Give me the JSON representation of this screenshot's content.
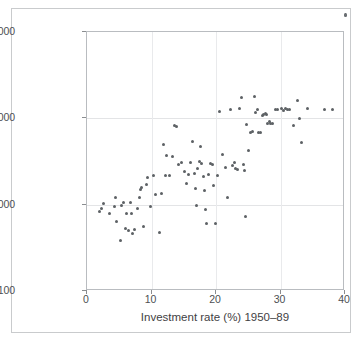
{
  "chart_data": {
    "type": "scatter",
    "title": "",
    "subtitle": "",
    "xlabel": "Investment rate (%) 1950–89",
    "ylabel": "GDP per capita (log scale) 1989",
    "xlim": [
      0,
      40
    ],
    "ylim": [
      100,
      100000
    ],
    "yscale": "log",
    "xticks": [
      "0",
      "10",
      "20",
      "30",
      "40"
    ],
    "xtick_values": [
      0,
      10,
      20,
      30,
      40
    ],
    "yticks": [
      "100",
      "1,000",
      "10,000",
      "100,000"
    ],
    "ytick_values": [
      100,
      1000,
      10000,
      100000
    ],
    "grid": "both-light",
    "legend": "none",
    "marker": {
      "shape": "circle",
      "color": "#5d6165",
      "size_px": 3
    },
    "n_points": 105,
    "points": [
      [
        2.0,
        840
      ],
      [
        2.2,
        900
      ],
      [
        2.6,
        1040
      ],
      [
        3.5,
        800
      ],
      [
        4.2,
        960
      ],
      [
        4.4,
        1210
      ],
      [
        4.6,
        640
      ],
      [
        5.2,
        380
      ],
      [
        5.4,
        980
      ],
      [
        5.6,
        1050
      ],
      [
        5.9,
        530
      ],
      [
        6.1,
        780
      ],
      [
        6.4,
        500
      ],
      [
        6.7,
        1060
      ],
      [
        6.9,
        800
      ],
      [
        7.1,
        460
      ],
      [
        7.4,
        520
      ],
      [
        7.9,
        900
      ],
      [
        8.1,
        1210
      ],
      [
        8.3,
        1480
      ],
      [
        8.5,
        1560
      ],
      [
        8.8,
        560
      ],
      [
        9.2,
        1700
      ],
      [
        9.4,
        2050
      ],
      [
        9.8,
        950
      ],
      [
        10.3,
        2150
      ],
      [
        10.6,
        1300
      ],
      [
        11.2,
        480
      ],
      [
        11.5,
        1350
      ],
      [
        11.8,
        5000
      ],
      [
        12.1,
        2150
      ],
      [
        12.4,
        3700
      ],
      [
        12.8,
        2150
      ],
      [
        13.2,
        3600
      ],
      [
        13.6,
        8200
      ],
      [
        13.9,
        8100
      ],
      [
        14.2,
        2900
      ],
      [
        14.6,
        3050
      ],
      [
        15.1,
        2450
      ],
      [
        15.4,
        1780
      ],
      [
        15.8,
        2250
      ],
      [
        16.1,
        3100
      ],
      [
        16.4,
        5400
      ],
      [
        16.6,
        2300
      ],
      [
        16.8,
        1520
      ],
      [
        17.0,
        980
      ],
      [
        17.2,
        2600
      ],
      [
        17.4,
        3150
      ],
      [
        17.6,
        4700
      ],
      [
        17.8,
        3000
      ],
      [
        18.0,
        2100
      ],
      [
        18.2,
        1450
      ],
      [
        18.4,
        870
      ],
      [
        18.6,
        610
      ],
      [
        18.9,
        2250
      ],
      [
        19.1,
        3000
      ],
      [
        19.4,
        2950
      ],
      [
        19.6,
        1650
      ],
      [
        19.9,
        610
      ],
      [
        20.3,
        2150
      ],
      [
        20.6,
        12000
      ],
      [
        21.0,
        3800
      ],
      [
        21.4,
        2700
      ],
      [
        21.8,
        1200
      ],
      [
        22.2,
        12800
      ],
      [
        22.5,
        2850
      ],
      [
        22.8,
        3100
      ],
      [
        23.1,
        2650
      ],
      [
        23.4,
        2550
      ],
      [
        23.7,
        13000
      ],
      [
        23.9,
        17500
      ],
      [
        24.2,
        2900
      ],
      [
        24.4,
        2500
      ],
      [
        24.6,
        720
      ],
      [
        24.8,
        8500
      ],
      [
        25.0,
        4200
      ],
      [
        25.3,
        6900
      ],
      [
        25.6,
        7100
      ],
      [
        25.9,
        17800
      ],
      [
        26.2,
        11800
      ],
      [
        26.4,
        12500
      ],
      [
        26.6,
        6800
      ],
      [
        26.9,
        6800
      ],
      [
        27.2,
        10900
      ],
      [
        27.4,
        11100
      ],
      [
        27.6,
        11300
      ],
      [
        27.8,
        11000
      ],
      [
        28.0,
        8700
      ],
      [
        28.3,
        9200
      ],
      [
        28.5,
        8600
      ],
      [
        28.8,
        8700
      ],
      [
        29.2,
        12700
      ],
      [
        29.6,
        12600
      ],
      [
        30.1,
        12900
      ],
      [
        30.5,
        12300
      ],
      [
        30.8,
        13000
      ],
      [
        31.1,
        12600
      ],
      [
        31.4,
        12800
      ],
      [
        32.0,
        8300
      ],
      [
        32.6,
        16200
      ],
      [
        33.0,
        10000
      ],
      [
        33.3,
        5200
      ],
      [
        34.2,
        13000
      ],
      [
        36.8,
        12600
      ],
      [
        38.0,
        12700
      ]
    ]
  },
  "annotations": {
    "corner_mark": "figure-corner-dot"
  }
}
